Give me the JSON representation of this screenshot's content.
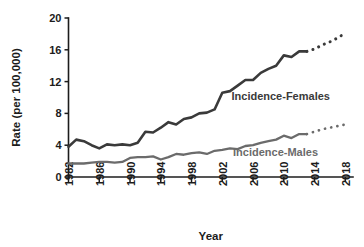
{
  "chart_data": {
    "type": "line",
    "title": "",
    "xlabel": "Year",
    "ylabel": "Rate (per 100,000)",
    "xlim": [
      1982,
      2019
    ],
    "ylim": [
      0,
      20
    ],
    "grid": false,
    "legend_position": "inline-annotation",
    "y_ticks": [
      0,
      4,
      8,
      12,
      16,
      20
    ],
    "y_tick_labels": [
      "0",
      "4",
      "8",
      "12",
      "16",
      "20"
    ],
    "x_ticks": [
      1982,
      1986,
      1990,
      1994,
      1998,
      2002,
      2006,
      2010,
      2014,
      2018
    ],
    "x_tick_labels": [
      "1982",
      "1986",
      "1990",
      "1994",
      "1998",
      "2002",
      "2006",
      "2010",
      "2014",
      "2018"
    ],
    "x": [
      1982,
      1983,
      1984,
      1985,
      1986,
      1987,
      1988,
      1989,
      1990,
      1991,
      1992,
      1993,
      1994,
      1995,
      1996,
      1997,
      1998,
      1999,
      2000,
      2001,
      2002,
      2003,
      2004,
      2005,
      2006,
      2007,
      2008,
      2009,
      2010,
      2011,
      2012,
      2013
    ],
    "series": [
      {
        "name": "Incidence-Females",
        "color": "#3a3a3a",
        "label": "Incidence-Females",
        "label_x": 2003.2,
        "label_y": 9.7,
        "values": [
          3.8,
          4.7,
          4.5,
          4.0,
          3.6,
          4.1,
          4.0,
          4.1,
          4.0,
          4.3,
          5.7,
          5.6,
          6.2,
          6.9,
          6.6,
          7.3,
          7.5,
          8.0,
          8.1,
          8.5,
          10.6,
          10.8,
          11.5,
          12.2,
          12.2,
          13.1,
          13.6,
          14.0,
          15.3,
          15.1,
          15.8,
          15.8
        ],
        "projection": {
          "style": "dotted",
          "x": [
            2013,
            2014,
            2015,
            2016,
            2017,
            2018
          ],
          "values": [
            15.8,
            16.1,
            16.6,
            17.0,
            17.5,
            18.1
          ]
        }
      },
      {
        "name": "Incidence-Males",
        "color": "#6b6b6b",
        "label": "Incidence-Males",
        "label_x": 2003.4,
        "label_y": 2.6,
        "values": [
          1.7,
          1.7,
          1.7,
          1.8,
          1.9,
          1.9,
          1.8,
          1.9,
          2.4,
          2.5,
          2.5,
          2.6,
          2.2,
          2.5,
          2.9,
          2.8,
          3.0,
          3.1,
          2.9,
          3.3,
          3.4,
          3.6,
          3.5,
          3.9,
          4.0,
          4.3,
          4.5,
          4.7,
          5.2,
          4.9,
          5.4,
          5.4
        ],
        "projection": {
          "style": "dotted",
          "x": [
            2013,
            2014,
            2015,
            2016,
            2017,
            2018
          ],
          "values": [
            5.4,
            5.7,
            6.0,
            6.2,
            6.4,
            6.6
          ]
        }
      }
    ]
  }
}
